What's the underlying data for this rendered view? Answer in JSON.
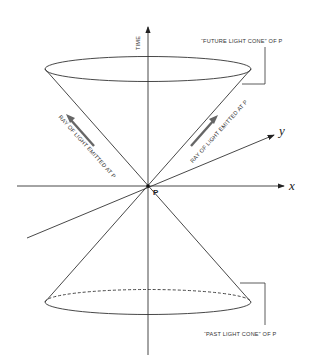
{
  "diagram": {
    "axes": {
      "time_label": "TIME",
      "x_label": "x",
      "y_label": "y"
    },
    "point_label": "P",
    "future_cone_label": "“FUTURE LIGHT CONE” OF P",
    "past_cone_label": "“PAST LIGHT CONE” OF P",
    "ray_left_label": "RAY OF LIGHT EMITTED AT P",
    "ray_right_label": "RAY OF LIGHT EMITTED AT P",
    "colors": {
      "line": "#333333",
      "arrow": "#555555",
      "background": "#ffffff"
    }
  }
}
